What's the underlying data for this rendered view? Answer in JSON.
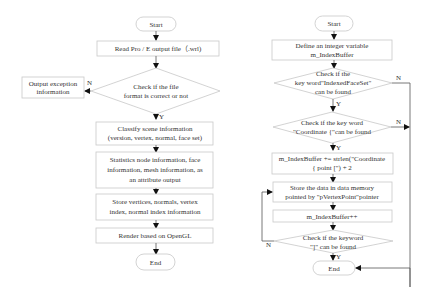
{
  "left_flowchart": {
    "start": "Start",
    "read_file": "Read Pro / E output file（.wrl)",
    "check_format": [
      "Check if the file",
      "format is correct or not"
    ],
    "exception": [
      "Output exception",
      "information"
    ],
    "classify": [
      "Classify scene information",
      "(version, vertex, normal, face set)"
    ],
    "statistics": [
      "Statistics node information, face",
      "information, mesh information, as",
      "an attribute output"
    ],
    "store": [
      "Store vertices, normals, vertex",
      "index, normal index information"
    ],
    "render": "Render based on OpenGL",
    "end": "End",
    "label_yes": "Y",
    "label_no": "N"
  },
  "right_flowchart": {
    "start": "Start",
    "define": [
      "Define an integer variable",
      "m_IndexBuffer"
    ],
    "check_indexed": [
      "Check if  the",
      "key word\"IndexedFaceSet\"",
      "can be found"
    ],
    "check_coordinate": [
      "Check if  the key word",
      "\"Coordinate {\"can be found"
    ],
    "assign": [
      "m_IndexBuffer += strlen(\"Coordinate",
      "{ point [\") + 2"
    ],
    "store_data": [
      "Store the data in data memory",
      "pointed by \"pVertexPoint\"pointer"
    ],
    "increment": "m_IndexBuffer++",
    "check_bracket": [
      "Check if the keyword",
      "\"]\" can be found"
    ],
    "end": "End",
    "label_yes": "Y",
    "label_no": "N"
  }
}
